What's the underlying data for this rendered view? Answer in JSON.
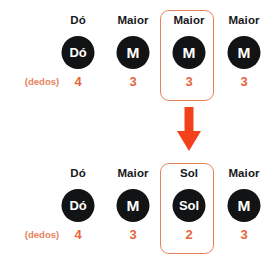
{
  "diagram": {
    "title_hidden": "",
    "accent_color": "#E8653C",
    "box_border_color": "#E8825E",
    "circle_color": "#121314",
    "arrow_color": "#F4411C",
    "legend": {
      "fingers_label": "(dedos)"
    },
    "rows": [
      {
        "id": "before",
        "cells": [
          {
            "label": "Dó",
            "badge": "Dó",
            "finger": "4",
            "highlighted": false
          },
          {
            "label": "Maior",
            "badge": "M",
            "finger": "3",
            "highlighted": false
          },
          {
            "label": "Maior",
            "badge": "M",
            "finger": "3",
            "highlighted": true
          },
          {
            "label": "Maior",
            "badge": "M",
            "finger": "3",
            "highlighted": false
          }
        ]
      },
      {
        "id": "after",
        "cells": [
          {
            "label": "Dó",
            "badge": "Dó",
            "finger": "4",
            "highlighted": false
          },
          {
            "label": "Maior",
            "badge": "M",
            "finger": "3",
            "highlighted": false
          },
          {
            "label": "Sol",
            "badge": "Sol",
            "finger": "2",
            "highlighted": true
          },
          {
            "label": "Maior",
            "badge": "M",
            "finger": "3",
            "highlighted": false
          }
        ]
      }
    ],
    "arrow": {
      "name": "down-arrow-icon",
      "direction": "down"
    }
  }
}
